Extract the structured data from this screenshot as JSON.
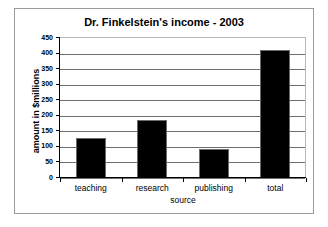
{
  "chart_data": {
    "type": "bar",
    "title": "Dr. Finkelstein's income - 2003",
    "xlabel": "source",
    "ylabel": "amount in $millions",
    "categories": [
      "teaching",
      "research",
      "publishing",
      "total"
    ],
    "values": [
      130,
      185,
      93,
      410
    ],
    "ylim": [
      0,
      450
    ],
    "ytick_step": 50,
    "yticks": [
      0,
      50,
      100,
      150,
      200,
      250,
      300,
      350,
      400,
      450
    ],
    "ytick_labels": [
      "0",
      "50",
      "100",
      "150",
      "200",
      "250",
      "300",
      "350",
      "400",
      "450"
    ],
    "grid": true,
    "grid_axis": "y",
    "legend": false,
    "legend_position": "none",
    "series": [
      {
        "name": "income",
        "values": [
          130,
          185,
          93,
          410
        ],
        "color": "#000000"
      }
    ],
    "colors": {
      "bar_fill": "#000000",
      "bar_edge": "#6b6b6b",
      "gridline": "#6e6e6e",
      "axis": "#000000",
      "plot_background": "#ffffff",
      "frame_border": "#9a9a9a",
      "text": "#000000"
    }
  }
}
